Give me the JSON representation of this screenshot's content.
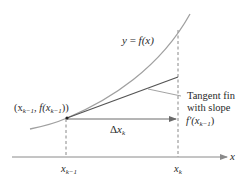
{
  "diagram": {
    "curve_label": {
      "y": "y",
      "eq": " = ",
      "f": "f",
      "arg": "(x)"
    },
    "point_label": "(x_{k-1}, f(x_{k-1}))",
    "point_parts": {
      "open": "(x",
      "sub1": "k−1",
      "mid": ", f(x",
      "sub2": "k−1",
      "close": "))"
    },
    "tangent_label": {
      "line1": "Tangent fin",
      "line2": "with slope",
      "line3_f": "f′(x",
      "line3_sub": "k−1",
      "line3_close": ")"
    },
    "delta_label": {
      "delta": "Δ",
      "x": "x",
      "sub": "k"
    },
    "axis_label": "x",
    "ticks": [
      {
        "x": "x",
        "sub": "k−1"
      },
      {
        "x": "x",
        "sub": "k"
      }
    ],
    "colors": {
      "curve": "#a0a0a0",
      "tangent": "#5a5a5a",
      "axis": "#8a8a8a",
      "text": "#2a2a2a"
    }
  }
}
